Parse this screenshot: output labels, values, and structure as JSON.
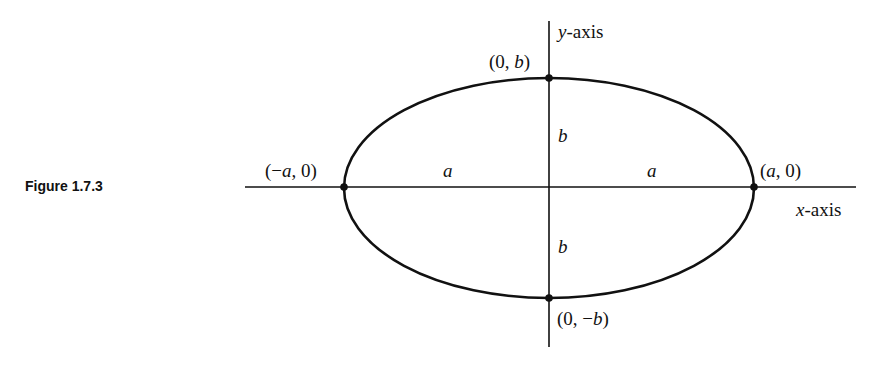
{
  "figure": {
    "caption": "Figure 1.7.3",
    "axes": {
      "x_label_var": "x",
      "x_label_rest": "-axis",
      "y_label_var": "y",
      "y_label_rest": "-axis"
    },
    "points": {
      "top": {
        "open": "(0, ",
        "var": "b",
        "close": ")"
      },
      "bottom": {
        "open": "(0, −",
        "var": "b",
        "close": ")"
      },
      "left": {
        "open": "(−",
        "var": "a",
        "close": ", 0)"
      },
      "right": {
        "open": "(",
        "var": "a",
        "close": ", 0)"
      }
    },
    "segment_labels": {
      "left_a": "a",
      "right_a": "a",
      "upper_b": "b",
      "lower_b": "b"
    },
    "colors": {
      "ink": "#111111",
      "background": "#ffffff"
    }
  }
}
